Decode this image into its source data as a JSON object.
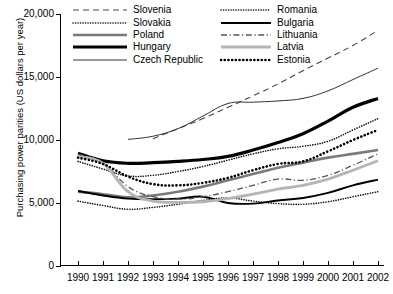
{
  "chart_data": {
    "type": "line",
    "title": "",
    "xlabel": "",
    "ylabel": "Purchasing power parities (US dollars per year)",
    "ylim": [
      0,
      20000
    ],
    "yticks": [
      0,
      5000,
      10000,
      15000,
      20000
    ],
    "ytick_labels": [
      "0",
      "5,000",
      "10,000",
      "15,000",
      "20,000"
    ],
    "grid": false,
    "legend_position": "top-inside",
    "x": [
      1990,
      1991,
      1992,
      1993,
      1994,
      1995,
      1996,
      1997,
      1998,
      1999,
      2000,
      2001,
      2002
    ],
    "xtick_labels": [
      "1990",
      "1991",
      "1992",
      "1993",
      "1994",
      "1995",
      "1996",
      "1997",
      "1998",
      "1999",
      "2000",
      "2001",
      "2002"
    ],
    "series": [
      {
        "name": "Slovenia",
        "style": "dashed",
        "color": "#444444",
        "width": 1.1,
        "x": [
          1993,
          1994,
          1995,
          1996,
          1997,
          1998,
          1999,
          2000,
          2001,
          2002
        ],
        "values": [
          10100,
          10900,
          11700,
          12600,
          13500,
          14450,
          15500,
          16500,
          17500,
          18700
        ]
      },
      {
        "name": "Slovakia",
        "style": "dotted-fine",
        "color": "#111111",
        "width": 1.6,
        "x": [
          1990,
          1991,
          1992,
          1993,
          1994,
          1995,
          1996,
          1997,
          1998,
          1999,
          2000,
          2001,
          2002
        ],
        "values": [
          8300,
          7700,
          7150,
          7200,
          7500,
          7900,
          8400,
          8900,
          9300,
          9500,
          9900,
          10800,
          11700
        ]
      },
      {
        "name": "Poland",
        "style": "solid",
        "color": "#7a7a7a",
        "width": 2.6,
        "x": [
          1990,
          1991,
          1992,
          1993,
          1994,
          1995,
          1996,
          1997,
          1998,
          1999,
          2000,
          2001,
          2002
        ],
        "values": [
          5900,
          5700,
          5450,
          5600,
          5900,
          6300,
          6800,
          7300,
          7800,
          8200,
          8600,
          8900,
          9200
        ]
      },
      {
        "name": "Hungary",
        "style": "solid",
        "color": "#000000",
        "width": 3.2,
        "x": [
          1990,
          1991,
          1992,
          1993,
          1994,
          1995,
          1996,
          1997,
          1998,
          1999,
          2000,
          2001,
          2002
        ],
        "values": [
          8950,
          8350,
          8150,
          8200,
          8300,
          8450,
          8700,
          9200,
          9800,
          10500,
          11500,
          12600,
          13300
        ]
      },
      {
        "name": "Czech Republic",
        "style": "solid",
        "color": "#333333",
        "width": 1.0,
        "x": [
          1992,
          1993,
          1994,
          1995,
          1996,
          1997,
          1998,
          1999,
          2000,
          2001,
          2002
        ],
        "values": [
          10050,
          10300,
          10900,
          11900,
          12900,
          13000,
          13100,
          13300,
          13900,
          14800,
          15700
        ]
      },
      {
        "name": "Romania",
        "style": "dotted-fine",
        "color": "#111111",
        "width": 1.6,
        "x": [
          1990,
          1991,
          1992,
          1993,
          1994,
          1995,
          1996,
          1997,
          1998,
          1999,
          2000,
          2001,
          2002
        ],
        "values": [
          5150,
          4800,
          4500,
          4650,
          4900,
          5200,
          5400,
          5150,
          4950,
          4900,
          5100,
          5500,
          5900
        ]
      },
      {
        "name": "Bulgaria",
        "style": "solid",
        "color": "#000000",
        "width": 1.9,
        "x": [
          1990,
          1991,
          1992,
          1993,
          1994,
          1995,
          1996,
          1997,
          1998,
          1999,
          2000,
          2001,
          2002
        ],
        "values": [
          5950,
          5600,
          5350,
          5300,
          5350,
          5500,
          5000,
          4950,
          5200,
          5400,
          5800,
          6400,
          6850
        ]
      },
      {
        "name": "Lithuania",
        "style": "dash-dot",
        "color": "#555555",
        "width": 1.3,
        "x": [
          1990,
          1991,
          1992,
          1993,
          1994,
          1995,
          1996,
          1997,
          1998,
          1999,
          2000,
          2001,
          2002
        ],
        "values": [
          8850,
          8200,
          6300,
          5500,
          5300,
          5500,
          5900,
          6400,
          6900,
          6800,
          7200,
          8000,
          8900
        ]
      },
      {
        "name": "Latvia",
        "style": "solid",
        "color": "#b5b5b5",
        "width": 2.8,
        "x": [
          1990,
          1991,
          1992,
          1993,
          1994,
          1995,
          1996,
          1997,
          1998,
          1999,
          2000,
          2001,
          2002
        ],
        "values": [
          8700,
          8150,
          5900,
          5150,
          5050,
          5100,
          5350,
          5700,
          6100,
          6400,
          6900,
          7600,
          8350
        ]
      },
      {
        "name": "Estonia",
        "style": "dotted-bold",
        "color": "#000000",
        "width": 2.6,
        "x": [
          1990,
          1991,
          1992,
          1993,
          1994,
          1995,
          1996,
          1997,
          1998,
          1999,
          2000,
          2001,
          2002
        ],
        "values": [
          8600,
          8100,
          7100,
          6500,
          6400,
          6600,
          7000,
          7600,
          8100,
          8300,
          9100,
          10000,
          10800
        ]
      }
    ],
    "legend_left": [
      "Slovenia",
      "Slovakia",
      "Poland",
      "Hungary",
      "Czech Republic"
    ],
    "legend_right": [
      "Romania",
      "Bulgaria",
      "Lithuania",
      "Latvia",
      "Estonia"
    ]
  }
}
